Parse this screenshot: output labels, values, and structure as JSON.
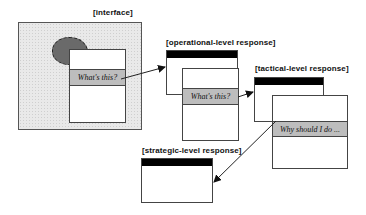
{
  "diagram": {
    "interface": {
      "label": "[interface]",
      "popup_question": "What's this?"
    },
    "operational": {
      "label": "[operational-level response]",
      "popup_question": "What's this?"
    },
    "tactical": {
      "label": "[tactical-level response]",
      "popup_question": "Why should I do ..."
    },
    "strategic": {
      "label": "[strategic-level response]"
    },
    "colors": {
      "title_bar": "#000000",
      "highlight_band": "#bdbdbd",
      "blob": "#6a6a6a",
      "interface_bg": "#e9e9e9"
    },
    "arrows": [
      {
        "from": "interface.popup_question",
        "to": "operational"
      },
      {
        "from": "operational.popup_question",
        "to": "tactical"
      },
      {
        "from": "tactical.popup_question",
        "to": "strategic"
      }
    ]
  }
}
